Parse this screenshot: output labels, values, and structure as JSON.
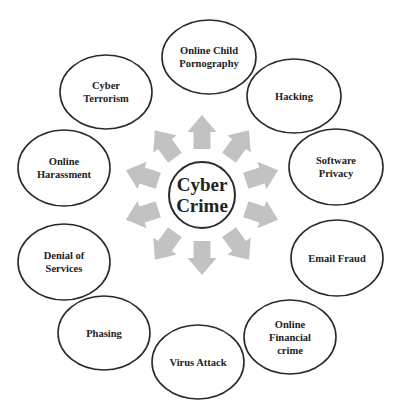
{
  "diagram": {
    "type": "radial-concept-map",
    "colors": {
      "arrow": "#c2c2c2",
      "stroke": "#2a2a2a",
      "text": "#222222",
      "background": "#ffffff"
    },
    "center": {
      "label": "Cyber\nCrime",
      "x": 202,
      "y": 195,
      "r": 33
    },
    "nodes": [
      {
        "id": "online-child-pornography",
        "label": "Online Child\nPornography",
        "x": 209,
        "y": 57,
        "rx": 47,
        "ry": 37
      },
      {
        "id": "hacking",
        "label": "Hacking",
        "x": 294,
        "y": 96,
        "rx": 47,
        "ry": 37
      },
      {
        "id": "software-privacy",
        "label": "Software\nPrivacy",
        "x": 336,
        "y": 167,
        "rx": 47,
        "ry": 38
      },
      {
        "id": "email-fraud",
        "label": "Email Fraud",
        "x": 337,
        "y": 258,
        "rx": 46,
        "ry": 38
      },
      {
        "id": "online-financial-crime",
        "label": "Online\nFinancial\ncrime",
        "x": 290,
        "y": 337,
        "rx": 46,
        "ry": 37
      },
      {
        "id": "virus-attack",
        "label": "Virus Attack",
        "x": 198,
        "y": 362,
        "rx": 46,
        "ry": 37
      },
      {
        "id": "phasing",
        "label": "Phasing",
        "x": 104,
        "y": 333,
        "rx": 46,
        "ry": 37
      },
      {
        "id": "denial-of-services",
        "label": "Denial of\nServices",
        "x": 64,
        "y": 262,
        "rx": 46,
        "ry": 38
      },
      {
        "id": "online-harassment",
        "label": "Online\nHarassment",
        "x": 64,
        "y": 168,
        "rx": 46,
        "ry": 38
      },
      {
        "id": "cyber-terrorism",
        "label": "Cyber\nTerrorism",
        "x": 106,
        "y": 92,
        "rx": 46,
        "ry": 37
      }
    ],
    "arrows": [
      {
        "angle": -90
      },
      {
        "angle": -54
      },
      {
        "angle": -18
      },
      {
        "angle": 18
      },
      {
        "angle": 54
      },
      {
        "angle": 90
      },
      {
        "angle": 126
      },
      {
        "angle": 162
      },
      {
        "angle": 198
      },
      {
        "angle": 234
      }
    ]
  }
}
